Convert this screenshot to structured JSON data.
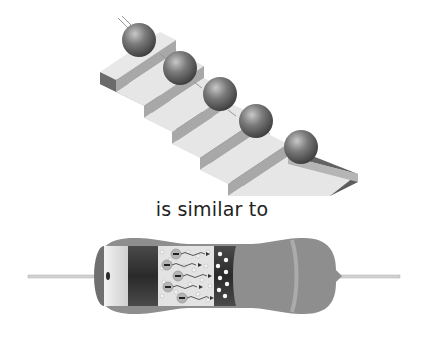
{
  "figure": {
    "caption": "is similar to",
    "top_illustration": {
      "subject": "staircase-with-balls",
      "ball_count": 5,
      "colors": {
        "step_top": "#e6e6e6",
        "step_riser": "#a9a9a9",
        "side": "#6e6e6e",
        "ball": "#6a6a6a"
      }
    },
    "bottom_illustration": {
      "subject": "resistor-cutaway",
      "electron_count": 5,
      "colors": {
        "body": "#8c8c8c",
        "lead": "#d0d0d0",
        "core_dark": "#3a3a3a",
        "core_light": "#e4e4e4",
        "band": "#a8a8a8"
      }
    }
  }
}
